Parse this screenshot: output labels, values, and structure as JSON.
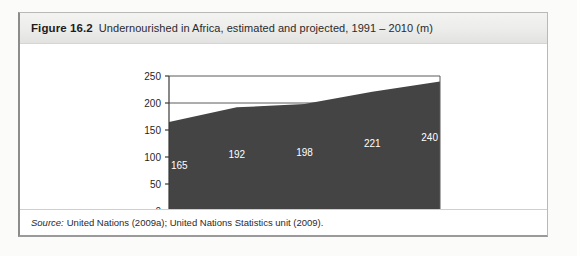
{
  "figure": {
    "number_label": "Figure 16.2",
    "title": "Undernourished in Africa, estimated and projected, 1991 – 2010 (m)",
    "source_prefix": "Source:",
    "source_text": "United Nations (2009a); United Nations Statistics unit (2009)."
  },
  "chart_data": {
    "type": "area",
    "title": "Undernourished in Africa, estimated and projected, 1991 – 2010 (m)",
    "xlabel": "",
    "ylabel": "",
    "categories": [
      "1991",
      "1996",
      "2001",
      "2005",
      "2010"
    ],
    "values": [
      165,
      192,
      198,
      221,
      240
    ],
    "point_labels": [
      "165",
      "192",
      "198",
      "221",
      "240"
    ],
    "ylim": [
      0,
      250
    ],
    "yticks": [
      0,
      50,
      100,
      150,
      200,
      250
    ],
    "ytick_labels": [
      "0",
      "50",
      "100",
      "150",
      "200",
      "250"
    ],
    "grid": true,
    "gridlines_at": [
      200,
      250
    ],
    "legend": "none",
    "series_fill_color": "#444444",
    "label_color": "#ffffff",
    "axis_color": "#1f1f1f"
  }
}
